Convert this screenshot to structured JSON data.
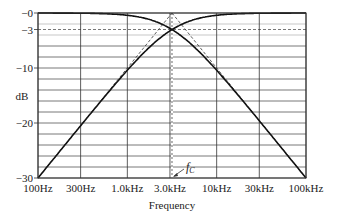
{
  "chart_data": {
    "type": "line",
    "title": "",
    "xlabel": "Frequency",
    "ylabel": "dB",
    "xscale": "log",
    "xlim": [
      100,
      100000
    ],
    "ylim": [
      -30,
      0
    ],
    "x_ticks": [
      {
        "value": 100,
        "label": "100Hz"
      },
      {
        "value": 300,
        "label": "300Hz"
      },
      {
        "value": 1000,
        "label": "1.0kHz"
      },
      {
        "value": 3000,
        "label": "3.0kHz"
      },
      {
        "value": 10000,
        "label": "10kHz"
      },
      {
        "value": 30000,
        "label": "30kHz"
      },
      {
        "value": 100000,
        "label": "100kHz"
      }
    ],
    "y_ticks": [
      {
        "value": 0,
        "label": "-0"
      },
      {
        "value": -3,
        "label": "-3"
      },
      {
        "value": -10,
        "label": "-10"
      },
      {
        "value": -20,
        "label": "-20"
      },
      {
        "value": -30,
        "label": "-30"
      }
    ],
    "grid": {
      "horizontal_step_db": 2,
      "vertical_at_ticks": true,
      "dashed_reference_db": -3
    },
    "cutoff": {
      "label": "fC",
      "label_main": "f",
      "label_sub": "C",
      "frequency": 3162
    },
    "series": [
      {
        "name": "Low-pass response",
        "style": "solid",
        "order": 1,
        "cutoff_hz": 3162,
        "x": [
          100,
          300,
          1000,
          3162,
          10000,
          30000,
          100000
        ],
        "values": [
          0,
          -0.04,
          -0.41,
          -3.01,
          -10.41,
          -19.59,
          -30.0
        ]
      },
      {
        "name": "High-pass response",
        "style": "solid",
        "order": 1,
        "cutoff_hz": 3162,
        "x": [
          100,
          300,
          1000,
          3162,
          10000,
          30000,
          100000
        ],
        "values": [
          -30.0,
          -20.5,
          -10.41,
          -3.01,
          -0.41,
          -0.05,
          0
        ]
      },
      {
        "name": "Low-pass asymptote",
        "style": "dashed",
        "x": [
          3162,
          100000
        ],
        "values": [
          0,
          -30
        ]
      },
      {
        "name": "High-pass asymptote",
        "style": "dashed",
        "x": [
          100,
          3162
        ],
        "values": [
          -30,
          0
        ]
      }
    ]
  }
}
